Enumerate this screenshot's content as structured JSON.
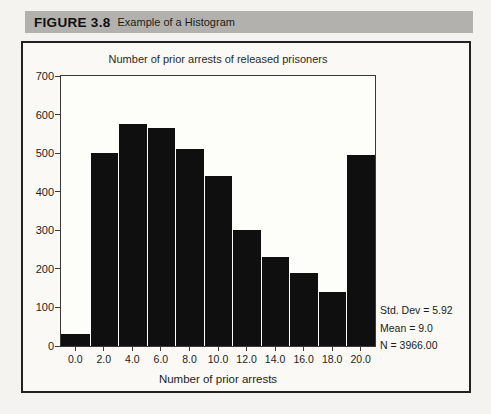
{
  "header": {
    "figure_label": "FIGURE 3.8",
    "figure_title": "Example of a Histogram"
  },
  "chart_data": {
    "type": "bar",
    "title": "Number of prior arrests of released prisoners",
    "xlabel": "Number of prior arrests",
    "ylabel": "",
    "categories": [
      "0.0",
      "2.0",
      "4.0",
      "6.0",
      "8.0",
      "10.0",
      "12.0",
      "14.0",
      "16.0",
      "18.0",
      "20.0"
    ],
    "values": [
      30,
      500,
      575,
      565,
      510,
      440,
      300,
      230,
      190,
      140,
      495
    ],
    "ylim": [
      0,
      700
    ],
    "yticks": [
      0,
      100,
      200,
      300,
      400,
      500,
      600,
      700
    ],
    "grid": false,
    "legend_position": "none",
    "bar_gap_px": 1,
    "annotations": [
      "Std. Dev = 5.92",
      "Mean = 9.0",
      "N = 3966.00"
    ]
  },
  "colors": {
    "page_bg": "#f5f3ef",
    "header_bg": "#b3b1ae",
    "figure_box_bg": "#faf9f5",
    "plot_bg": "#fdfdfa",
    "bar": "#0f0f0f",
    "bar_gap": "#ffffff",
    "border": "#222222",
    "axis": "#3a3a3a",
    "text": "#1c1c1c"
  }
}
